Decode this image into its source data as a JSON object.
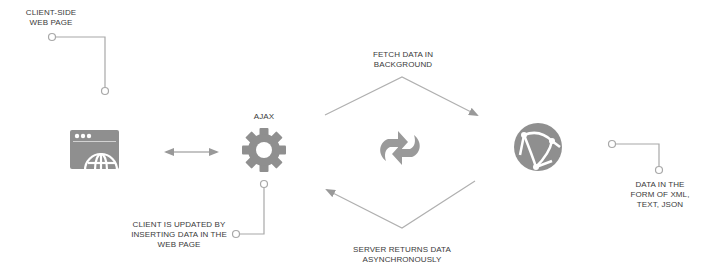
{
  "diagram": {
    "colors": {
      "icon": "#8f8f8f",
      "line": "#a8a8a8",
      "text": "#3a3a3a",
      "background": "#ffffff"
    },
    "nodes": [
      {
        "id": "client",
        "icon": "browser-globe-icon",
        "label": "CLIENT-SIDE\nWEB PAGE"
      },
      {
        "id": "ajax",
        "icon": "gear-icon",
        "label": "AJAX"
      },
      {
        "id": "sync",
        "icon": "refresh-arrows-icon"
      },
      {
        "id": "server",
        "icon": "network-globe-icon"
      }
    ],
    "labels": {
      "client_line1": "CLIENT-SIDE",
      "client_line2": "WEB PAGE",
      "ajax": "AJAX",
      "fetch_line1": "FETCH DATA IN",
      "fetch_line2": "BACKGROUND",
      "returns_line1": "SERVER RETURNS DATA",
      "returns_line2": "ASYNCHRONOUSLY",
      "updated_line1": "CLIENT IS UPDATED BY",
      "updated_line2": "INSERTING DATA IN THE",
      "updated_line3": "WEB PAGE",
      "format_line1": "DATA IN THE",
      "format_line2": "FORM OF XML,",
      "format_line3": "TEXT, JSON"
    },
    "edges": [
      {
        "from": "client",
        "to": "ajax",
        "type": "bidirectional"
      },
      {
        "from": "ajax",
        "to": "server",
        "label": "FETCH DATA IN BACKGROUND"
      },
      {
        "from": "server",
        "to": "ajax",
        "label": "SERVER RETURNS DATA ASYNCHRONOUSLY"
      }
    ]
  }
}
